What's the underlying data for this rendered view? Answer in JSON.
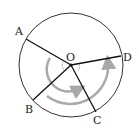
{
  "diagram": {
    "center": {
      "label": "O",
      "x": 71,
      "y": 65
    },
    "radius": 52,
    "points": [
      {
        "label": "A",
        "x": 26,
        "y": 39,
        "lx": 15,
        "ly": 37
      },
      {
        "label": "B",
        "x": 33,
        "y": 100,
        "lx": 24,
        "ly": 113
      },
      {
        "label": "C",
        "x": 96,
        "y": 112,
        "lx": 92,
        "ly": 124
      },
      {
        "label": "D",
        "x": 121,
        "y": 56,
        "lx": 124,
        "ly": 59
      }
    ],
    "arrows": [
      {
        "name": "inner-arc-arrow",
        "color": "#a8a8a8"
      },
      {
        "name": "outer-arc-arrow",
        "color": "#a8a8a8"
      }
    ],
    "colors": {
      "line": "#111111",
      "arc": "#a8a8a8"
    }
  }
}
